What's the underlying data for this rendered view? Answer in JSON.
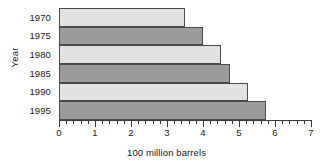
{
  "chart_data": {
    "type": "bar",
    "orientation": "horizontal",
    "title": "",
    "xlabel": "100 million barrels",
    "ylabel": "Year",
    "categories": [
      "1970",
      "1975",
      "1980",
      "1985",
      "1990",
      "1995"
    ],
    "values": [
      3.5,
      4.0,
      4.5,
      4.75,
      5.25,
      5.75
    ],
    "series": [
      {
        "name": "",
        "values": [
          3.5,
          4.0,
          4.5,
          4.75,
          5.25,
          5.75
        ]
      }
    ],
    "xlim": [
      0,
      7
    ],
    "xticks": [
      0,
      1,
      2,
      3,
      4,
      5,
      6,
      7
    ],
    "xtick_labels": [
      "0",
      "1",
      "2",
      "3",
      "4",
      "5",
      "6",
      "7"
    ],
    "minor_tick_step": 0.2,
    "ytick_labels": [
      "1970",
      "1975",
      "1980",
      "1985",
      "1990",
      "1995"
    ],
    "grid": false,
    "legend": null,
    "bar_colors": [
      "#e2e2e2",
      "#9b9b9b",
      "#e2e2e2",
      "#9b9b9b",
      "#e2e2e2",
      "#9b9b9b"
    ],
    "bar_edge_color": "#4a4a4a",
    "axis_color": "#3a3a3a",
    "background": "#ffffff"
  }
}
